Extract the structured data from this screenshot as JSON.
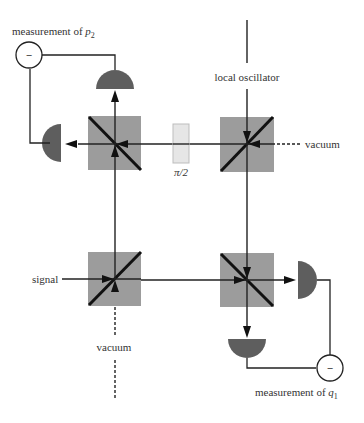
{
  "diagram": {
    "labels": {
      "measurement_p2_prefix": "measurement of ",
      "measurement_p2_var": "p",
      "measurement_p2_sub": "2",
      "measurement_q1_prefix": "measurement of ",
      "measurement_q1_var": "q",
      "measurement_q1_sub": "1",
      "local_oscillator": "local oscillator",
      "vacuum_right": "vacuum",
      "vacuum_bottom": "vacuum",
      "signal": "signal",
      "phase_plate": "π/2",
      "minus_top": "−",
      "minus_bottom": "−"
    },
    "components": [
      {
        "id": "bs-top-left",
        "type": "beam-splitter"
      },
      {
        "id": "bs-top-right",
        "type": "beam-splitter"
      },
      {
        "id": "bs-bottom-left",
        "type": "beam-splitter"
      },
      {
        "id": "bs-bottom-right",
        "type": "beam-splitter"
      },
      {
        "id": "phase-plate",
        "type": "phase-shifter",
        "label": "π/2"
      },
      {
        "id": "detector-top",
        "type": "photodetector"
      },
      {
        "id": "detector-left",
        "type": "photodetector"
      },
      {
        "id": "detector-right",
        "type": "photodetector"
      },
      {
        "id": "detector-bottom",
        "type": "photodetector"
      },
      {
        "id": "subtractor-p2",
        "type": "difference",
        "symbol": "−"
      },
      {
        "id": "subtractor-q1",
        "type": "difference",
        "symbol": "−"
      }
    ],
    "colors": {
      "beam_splitter": "#9c9c9c",
      "detector": "#5e5e5e",
      "plate": "#e6e6e6",
      "line": "#222222"
    }
  }
}
